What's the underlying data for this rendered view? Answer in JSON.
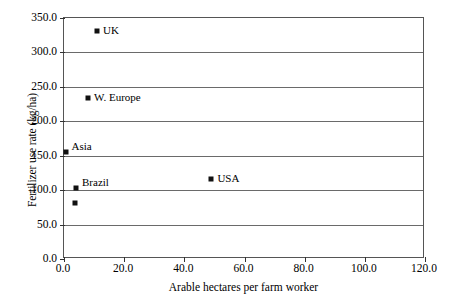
{
  "chart_data": {
    "type": "scatter",
    "title": "",
    "xlabel": "Arable hectares per farm worker",
    "ylabel": "Fertilizer use rate (kg/ha)",
    "xlim": [
      0.0,
      120.0
    ],
    "ylim": [
      0.0,
      350.0
    ],
    "xticks": [
      "0.0",
      "20.0",
      "40.0",
      "60.0",
      "80.0",
      "100.0",
      "120.0"
    ],
    "xtick_values": [
      0,
      20,
      40,
      60,
      80,
      100,
      120
    ],
    "yticks": [
      "0.0",
      "50.0",
      "100.0",
      "150.0",
      "200.0",
      "250.0",
      "300.0",
      "350.0"
    ],
    "ytick_values": [
      0,
      50,
      100,
      150,
      200,
      250,
      300,
      350
    ],
    "grid": "horizontal",
    "legend": "none",
    "marker_color": "#111111",
    "grid_color": "#6a6a6a",
    "axis_color": "#555555",
    "points": [
      {
        "name": "UK",
        "x": 11.0,
        "y": 331.0,
        "label": "UK",
        "label_pos": "right"
      },
      {
        "name": "W. Europe",
        "x": 8.0,
        "y": 234.0,
        "label": "W. Europe",
        "label_pos": "right"
      },
      {
        "name": "Asia",
        "x": 0.5,
        "y": 155.0,
        "label": "Asia",
        "label_pos": "above-right"
      },
      {
        "name": "USA",
        "x": 49.0,
        "y": 116.0,
        "label": "USA",
        "label_pos": "right"
      },
      {
        "name": "Brazil",
        "x": 4.0,
        "y": 103.0,
        "label": "Brazil",
        "label_pos": "above-right"
      },
      {
        "name": "Latin Am. & E. Europe",
        "x": 3.5,
        "y": 82.0,
        "label": "Latin Am. &",
        "label2": "E. Europe",
        "label_pos": "right"
      },
      {
        "name": "Canada",
        "x": 92.0,
        "y": 62.0,
        "label": "Canada",
        "label_pos": "right"
      },
      {
        "name": "Australia",
        "x": 115.0,
        "y": 48.0,
        "label": "Australia",
        "label_pos": "below-left"
      },
      {
        "name": "Argentina",
        "x": 17.0,
        "y": 33.0,
        "label": "Argentina",
        "label_pos": "right"
      },
      {
        "name": "Africa",
        "x": 1.5,
        "y": 14.0,
        "label": "Africa",
        "label_pos": "above-right"
      }
    ]
  }
}
